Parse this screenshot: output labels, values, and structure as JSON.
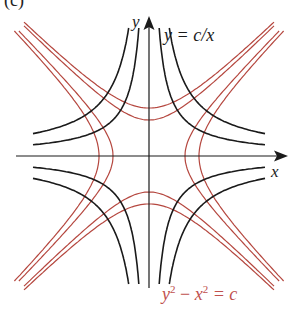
{
  "panel_label": "(c)",
  "axes": {
    "x_label": "x",
    "y_label": "y",
    "origin_px": [
      149,
      156
    ],
    "x_extent_px": [
      16,
      285
    ],
    "y_extent_px": [
      285,
      18
    ]
  },
  "equations": {
    "black": "y = c/x",
    "red_y": "y",
    "red_sup1": "2",
    "red_minus": " − ",
    "red_x": "x",
    "red_sup2": "2",
    "red_eq": " = c"
  },
  "colors": {
    "black_curve": "#1a1a1a",
    "red_curve": "#b5473f",
    "axis": "#1a1a1a"
  },
  "families": {
    "black": {
      "type": "xy = c",
      "c_values_px2": [
        1300,
        2600
      ]
    },
    "red_vertical_vertices": {
      "type": "x² − y² = a²",
      "a_px": [
        36,
        50
      ]
    },
    "red_horizontal_vertices": {
      "type": "y² − x² = a²",
      "a_px": [
        36,
        48
      ]
    }
  }
}
